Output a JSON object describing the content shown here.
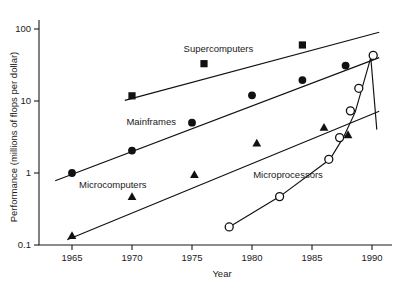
{
  "chart_data": {
    "type": "scatter",
    "title": "",
    "xlabel": "Year",
    "ylabel": "Performance (millions of flops per dollar)",
    "xlim": [
      1963,
      1991.5
    ],
    "ylim": [
      0.1,
      100
    ],
    "yscale": "log",
    "xscale": "linear",
    "grid": false,
    "legend_position": "inline-annotations",
    "xticks": [
      1965,
      1970,
      1975,
      1980,
      1985,
      1990
    ],
    "xtick_labels": [
      "1965",
      "1970",
      "1975",
      "1980",
      "1985",
      "1990"
    ],
    "yticks": [
      0.1,
      1,
      10,
      100
    ],
    "ytick_labels": [
      "0.1",
      "1",
      "10",
      "100"
    ],
    "series": [
      {
        "name": "Supercomputers",
        "marker": "filled-square",
        "label_x": 1977.2,
        "label_y": 48,
        "trend_from": [
          1969.4,
          10.2
        ],
        "trend_to": [
          1990.6,
          90
        ],
        "points": [
          {
            "x": 1970.0,
            "y": 11.8
          },
          {
            "x": 1976.0,
            "y": 33.0
          },
          {
            "x": 1984.2,
            "y": 60.0
          }
        ]
      },
      {
        "name": "Mainframes",
        "marker": "filled-circle",
        "label_x": 1971.6,
        "label_y": 4.6,
        "trend_from": [
          1963.6,
          0.78
        ],
        "trend_to": [
          1990.6,
          40.0
        ],
        "points": [
          {
            "x": 1965.0,
            "y": 1.0
          },
          {
            "x": 1970.0,
            "y": 2.05
          },
          {
            "x": 1975.0,
            "y": 5.0
          },
          {
            "x": 1980.0,
            "y": 12.0
          },
          {
            "x": 1984.2,
            "y": 19.5
          },
          {
            "x": 1987.8,
            "y": 31.0
          }
        ]
      },
      {
        "name": "Microcomputers",
        "marker": "filled-triangle",
        "label_x": 1968.4,
        "label_y": 0.62,
        "trend_from": [
          1964.6,
          0.118
        ],
        "trend_to": [
          1990.6,
          7.2
        ],
        "points": [
          {
            "x": 1965.0,
            "y": 0.135
          },
          {
            "x": 1970.0,
            "y": 0.47
          },
          {
            "x": 1975.2,
            "y": 0.95
          },
          {
            "x": 1980.4,
            "y": 2.6
          },
          {
            "x": 1986.0,
            "y": 4.3
          },
          {
            "x": 1988.0,
            "y": 3.4
          }
        ]
      },
      {
        "name": "Microprocessors",
        "marker": "open-circle",
        "label_x": 1983.0,
        "label_y": 0.85,
        "curve": [
          [
            1978.1,
            0.178
          ],
          [
            1982.3,
            0.47
          ],
          [
            1986.5,
            1.55
          ],
          [
            1987.6,
            3.1
          ],
          [
            1988.6,
            7.0
          ],
          [
            1989.9,
            40.0
          ],
          [
            1990.4,
            4.0
          ]
        ],
        "points": [
          {
            "x": 1978.1,
            "y": 0.178
          },
          {
            "x": 1982.3,
            "y": 0.47
          },
          {
            "x": 1986.4,
            "y": 1.55
          },
          {
            "x": 1987.3,
            "y": 3.1
          },
          {
            "x": 1988.2,
            "y": 7.3
          },
          {
            "x": 1988.9,
            "y": 15.0
          },
          {
            "x": 1990.1,
            "y": 43.0
          }
        ]
      }
    ]
  }
}
